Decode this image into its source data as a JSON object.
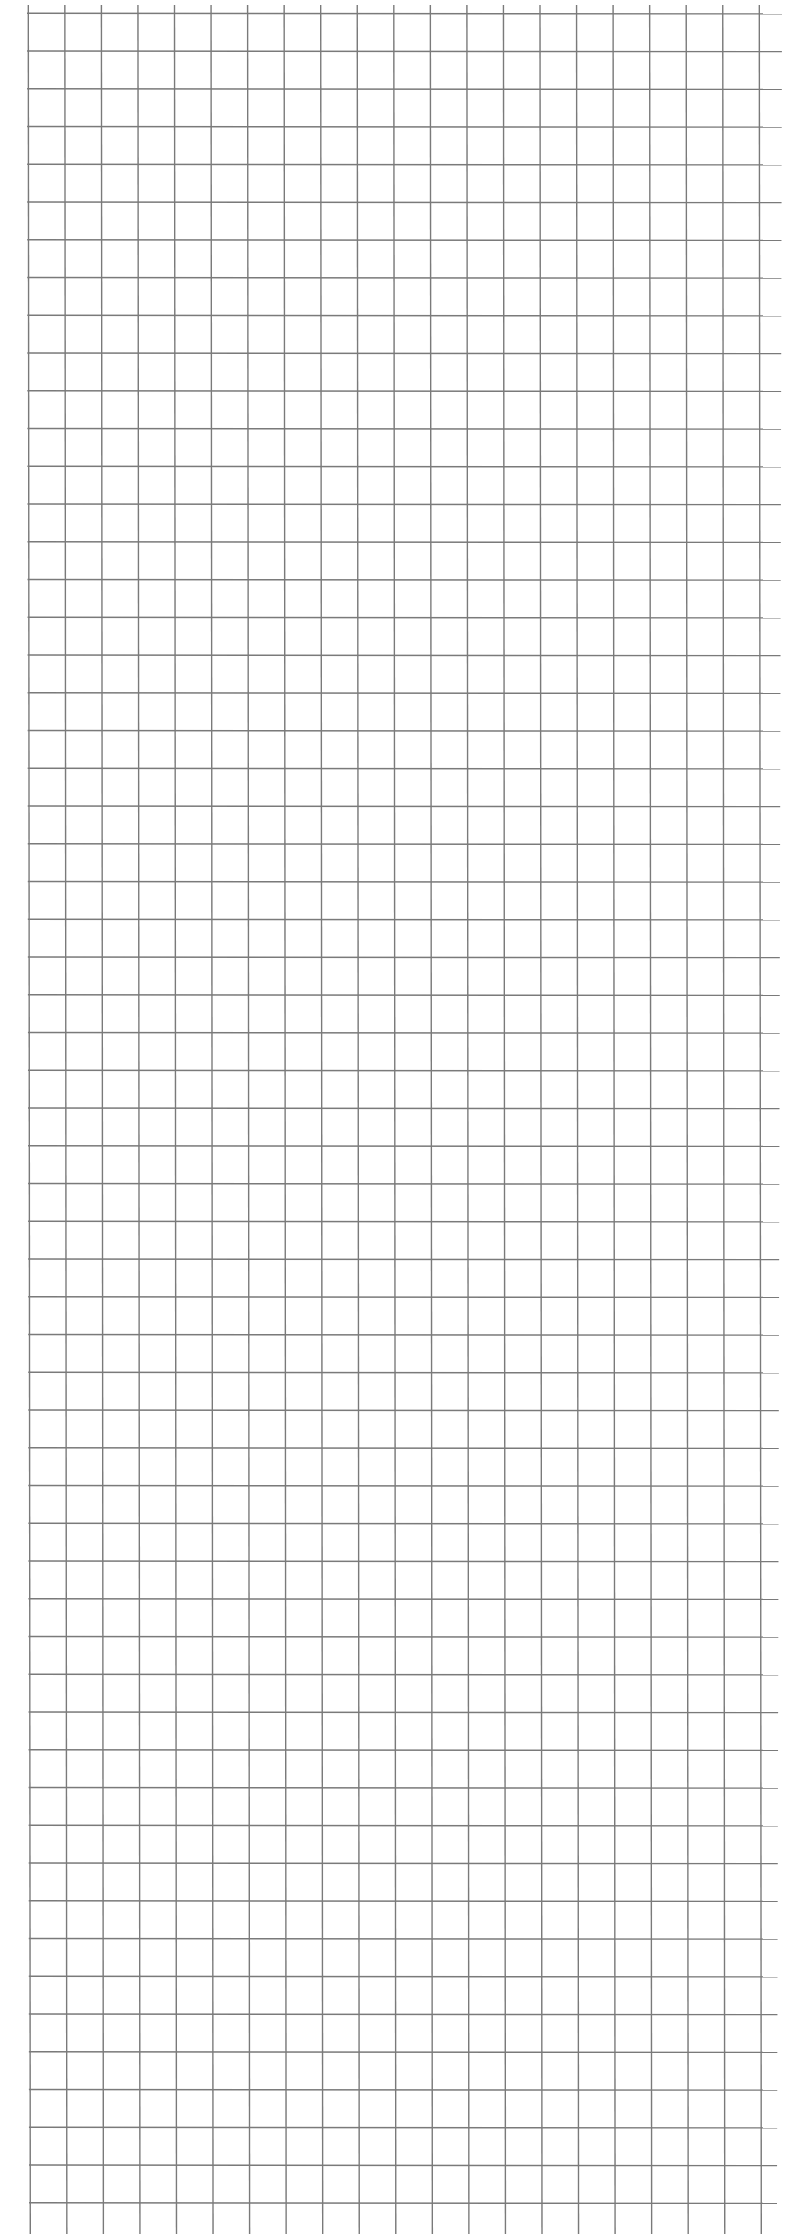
{
  "page": {
    "type": "graph-paper",
    "background_color": "#ffffff",
    "line_color": "#7a7a7a"
  },
  "grid": {
    "vertical_lines": {
      "count": 21,
      "x_start_top": 28.3,
      "x_start_bottom": 30.3,
      "spacing": 36.55,
      "y_top": 5,
      "y_bottom": 2234
    },
    "horizontal_lines": {
      "count": 59,
      "y_start": 13.3,
      "spacing": 37.75,
      "x_left": 27,
      "x_right_top": 782,
      "x_right_bottom": 777
    },
    "stroke_width": 1.4
  }
}
